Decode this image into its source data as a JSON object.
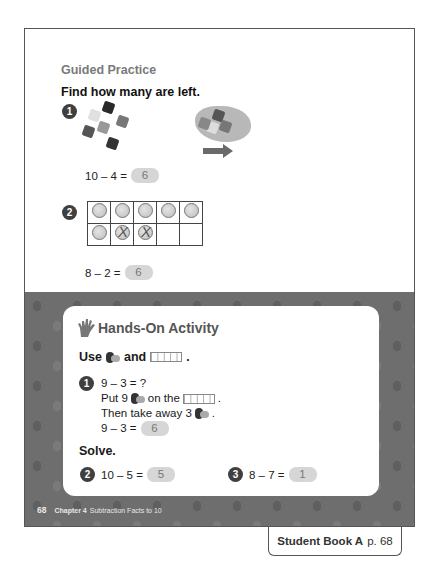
{
  "guided_practice": {
    "title": "Guided Practice",
    "instruction": "Find how many are left.",
    "problems": [
      {
        "number": "1",
        "picture": "10 connecting cubes, 4 moved into a bag (arrow pointing right)",
        "equation": "10 – 4 =",
        "answer": "6"
      },
      {
        "number": "2",
        "ten_frame": {
          "rows": [
            [
              "counter",
              "counter",
              "counter",
              "counter",
              "counter"
            ],
            [
              "counter",
              "crossed",
              "crossed",
              "empty",
              "empty"
            ]
          ]
        },
        "equation": "8 – 2 =",
        "answer": "6"
      }
    ]
  },
  "hands_on": {
    "title": "Hands-On Activity",
    "use_line": {
      "prefix": "Use",
      "middle": "and",
      "suffix": "."
    },
    "activity_1": {
      "number": "1",
      "lines": {
        "l1": "9 – 3 = ?",
        "l2a": "Put 9",
        "l2b": "on the",
        "l2c": ".",
        "l3a": "Then take away 3",
        "l3b": ".",
        "l4": "9 – 3 ="
      },
      "answer": "6"
    },
    "solve_label": "Solve.",
    "solve": [
      {
        "number": "2",
        "equation": "10 – 5 =",
        "answer": "5"
      },
      {
        "number": "3",
        "equation": "8 – 7 =",
        "answer": "1"
      }
    ]
  },
  "footer": {
    "page_number": "68",
    "chapter": "Chapter 4",
    "chapter_title": "Subtraction Facts to 10"
  },
  "reference_tab": {
    "book": "Student Book A",
    "page": "p. 68"
  },
  "colors": {
    "band": "#6e6e6e",
    "answer_box": "#d6d6d6",
    "badge": "#3f3f3f",
    "title_gray": "#7a7a7a"
  }
}
